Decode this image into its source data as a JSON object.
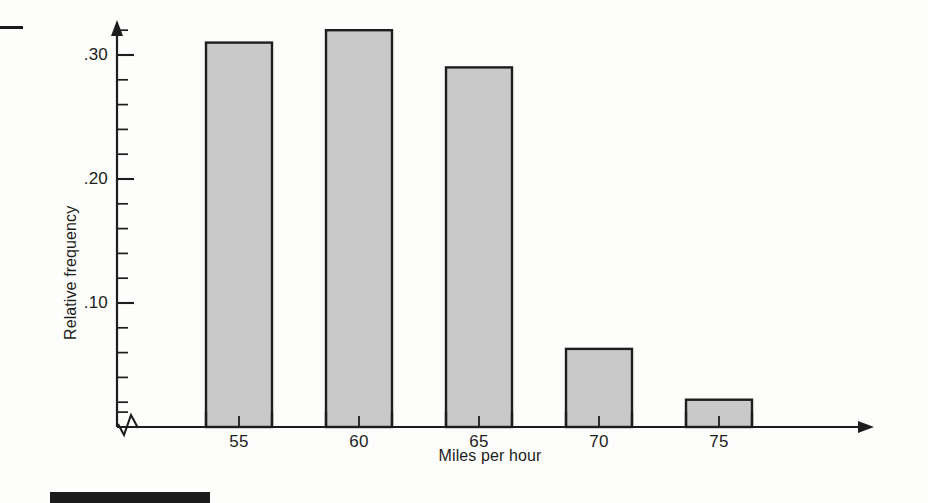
{
  "figure": {
    "bar_fill": "#c9c9c9",
    "bar_stroke": "#1e1e1e",
    "axis_color": "#1d1d1d",
    "background": "#fdfdfb",
    "axis_break_symbol": "zigzag-break",
    "x_axis_arrow": "arrowhead-right",
    "y_axis_arrow": "arrowhead-up"
  },
  "chart_data": {
    "type": "bar",
    "title": "",
    "subtitle": "",
    "xlabel": "Miles per hour",
    "ylabel": "Relative frequency",
    "categories": [
      "55",
      "60",
      "65",
      "70",
      "75"
    ],
    "values": [
      0.31,
      0.32,
      0.29,
      0.063,
      0.022
    ],
    "ylim": [
      0,
      0.335
    ],
    "ytick_labels": [
      ".10",
      ".20",
      ".30"
    ],
    "ytick_values": [
      0.1,
      0.2,
      0.3
    ],
    "yminor_step": 0.02,
    "xtick_labels": [
      "55",
      "60",
      "65",
      "70",
      "75"
    ],
    "grid": false,
    "legend": null,
    "annotations": []
  },
  "artifacts": {
    "top_dash_label": "",
    "footer_tab_label": ""
  }
}
